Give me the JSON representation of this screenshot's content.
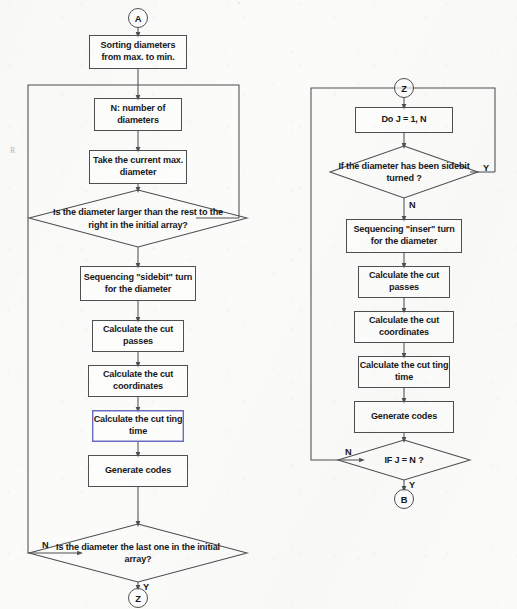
{
  "diagram": {
    "type": "flowchart",
    "background_color": "#fbfbf9",
    "line_color": "#4d4f51",
    "text_color": "#17181a",
    "selection_color": "#6a6cc4"
  },
  "left_column": {
    "entry_connector": "A",
    "exit_connector": "Z",
    "nodes": [
      {
        "id": "sorting",
        "shape": "process",
        "text": "Sorting diameters from max. to min."
      },
      {
        "id": "n-count",
        "shape": "process",
        "text": "N: number of diameters"
      },
      {
        "id": "take-max",
        "shape": "process",
        "text": "Take the current max. diameter"
      },
      {
        "id": "is-larger",
        "shape": "decision",
        "text": "Is the diameter larger than the rest to the right in the initial array?"
      },
      {
        "id": "seq-sidebit",
        "shape": "process",
        "text": "Sequencing \"sidebit\" turn for the diameter"
      },
      {
        "id": "cut-passes",
        "shape": "process",
        "text": "Calculate the cut passes"
      },
      {
        "id": "cut-coords",
        "shape": "process",
        "text": "Calculate the cut coordinates"
      },
      {
        "id": "cutting-time",
        "shape": "process",
        "text": "Calculate the cut ting time",
        "selected": true
      },
      {
        "id": "gen-codes",
        "shape": "process",
        "text": "Generate codes"
      },
      {
        "id": "is-last",
        "shape": "decision",
        "text": "Is the diameter the last one in the initial array?"
      }
    ],
    "branch_labels": {
      "is_larger_loop": "",
      "is_last_no": "N",
      "is_last_yes": "Y"
    }
  },
  "right_column": {
    "entry_connector": "Z",
    "exit_connector": "B",
    "nodes": [
      {
        "id": "do-loop",
        "shape": "process",
        "text": "Do  J = 1, N"
      },
      {
        "id": "is-sidebit",
        "shape": "decision",
        "text": "If the diameter has been sidebit turned ?"
      },
      {
        "id": "seq-inser",
        "shape": "process",
        "text": "Sequencing \"inser\" turn for the diameter"
      },
      {
        "id": "cut-passes-r",
        "shape": "process",
        "text": "Calculate the cut passes"
      },
      {
        "id": "cut-coords-r",
        "shape": "process",
        "text": "Calculate the cut coordinates"
      },
      {
        "id": "cutting-time-r",
        "shape": "process",
        "text": "Calculate the cut ting time"
      },
      {
        "id": "gen-codes-r",
        "shape": "process",
        "text": "Generate codes"
      },
      {
        "id": "if-j-eq-n",
        "shape": "decision",
        "text": "IF  J = N ?"
      }
    ],
    "branch_labels": {
      "is_sidebit_yes": "Y",
      "is_sidebit_no": "N",
      "if_j_no": "N",
      "if_j_yes": "Y"
    }
  },
  "artifacts": {
    "margin_mark_left": "R",
    "margin_mark_top": "'"
  }
}
